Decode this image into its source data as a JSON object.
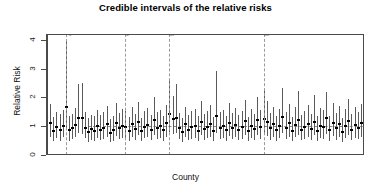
{
  "chart_data": {
    "type": "scatter",
    "title": "Credible intervals of the relative risks",
    "xlabel": "County",
    "ylabel": "Relative Risk",
    "ylim": [
      0,
      4.2
    ],
    "yticks": [
      0,
      1,
      2,
      3,
      4
    ],
    "ytick_labels": [
      "0",
      "1",
      "2",
      "3",
      "4"
    ],
    "xtick_labels": [],
    "grid": false,
    "legend": null,
    "reference_line": {
      "y": 1,
      "style": "dashed",
      "color": "#8a8a8a"
    },
    "annotations": [
      {
        "label": "Anson",
        "index": 5,
        "style": "dashed-vertical"
      },
      {
        "label": "Columbus",
        "index": 24,
        "style": "dashed-vertical"
      },
      {
        "label": "Halifax",
        "index": 38,
        "style": "dashed-vertical"
      },
      {
        "label": "Robeson",
        "index": 68,
        "style": "dashed-vertical"
      }
    ],
    "series_note": "Posterior median relative risk with 95% credible interval per county",
    "points": [
      {
        "i": 0,
        "median": 1.1,
        "low": 0.62,
        "high": 1.78
      },
      {
        "i": 1,
        "median": 0.82,
        "low": 0.47,
        "high": 1.32
      },
      {
        "i": 2,
        "median": 0.98,
        "low": 0.6,
        "high": 1.5
      },
      {
        "i": 3,
        "median": 0.88,
        "low": 0.5,
        "high": 1.42
      },
      {
        "i": 4,
        "median": 1.02,
        "low": 0.63,
        "high": 1.55
      },
      {
        "i": 5,
        "median": 1.68,
        "low": 0.95,
        "high": 3.95
      },
      {
        "i": 6,
        "median": 0.86,
        "low": 0.5,
        "high": 1.35
      },
      {
        "i": 7,
        "median": 0.92,
        "low": 0.55,
        "high": 1.44
      },
      {
        "i": 8,
        "median": 1.05,
        "low": 0.62,
        "high": 1.62
      },
      {
        "i": 9,
        "median": 1.3,
        "low": 0.75,
        "high": 2.45
      },
      {
        "i": 10,
        "median": 1.28,
        "low": 0.72,
        "high": 2.5
      },
      {
        "i": 11,
        "median": 0.95,
        "low": 0.58,
        "high": 1.48
      },
      {
        "i": 12,
        "median": 0.8,
        "low": 0.45,
        "high": 1.28
      },
      {
        "i": 13,
        "median": 0.9,
        "low": 0.52,
        "high": 1.4
      },
      {
        "i": 14,
        "median": 0.84,
        "low": 0.48,
        "high": 1.34
      },
      {
        "i": 15,
        "median": 1.0,
        "low": 0.6,
        "high": 1.55
      },
      {
        "i": 16,
        "median": 0.88,
        "low": 0.52,
        "high": 1.38
      },
      {
        "i": 17,
        "median": 0.94,
        "low": 0.55,
        "high": 1.5
      },
      {
        "i": 18,
        "median": 1.08,
        "low": 0.64,
        "high": 1.7
      },
      {
        "i": 19,
        "median": 0.78,
        "low": 0.44,
        "high": 1.26
      },
      {
        "i": 20,
        "median": 0.86,
        "low": 0.5,
        "high": 1.36
      },
      {
        "i": 21,
        "median": 1.12,
        "low": 0.66,
        "high": 1.82
      },
      {
        "i": 22,
        "median": 0.92,
        "low": 0.54,
        "high": 1.46
      },
      {
        "i": 23,
        "median": 1.02,
        "low": 0.6,
        "high": 1.6
      },
      {
        "i": 24,
        "median": 0.96,
        "low": 0.56,
        "high": 1.52
      },
      {
        "i": 25,
        "median": 0.84,
        "low": 0.48,
        "high": 1.33
      },
      {
        "i": 26,
        "median": 1.06,
        "low": 0.62,
        "high": 1.66
      },
      {
        "i": 27,
        "median": 0.9,
        "low": 0.53,
        "high": 1.42
      },
      {
        "i": 28,
        "median": 1.14,
        "low": 0.68,
        "high": 1.84
      },
      {
        "i": 29,
        "median": 0.82,
        "low": 0.47,
        "high": 1.3
      },
      {
        "i": 30,
        "median": 0.98,
        "low": 0.58,
        "high": 1.54
      },
      {
        "i": 31,
        "median": 1.04,
        "low": 0.62,
        "high": 1.62
      },
      {
        "i": 32,
        "median": 0.88,
        "low": 0.51,
        "high": 1.4
      },
      {
        "i": 33,
        "median": 1.2,
        "low": 0.7,
        "high": 2.0
      },
      {
        "i": 34,
        "median": 0.94,
        "low": 0.55,
        "high": 1.48
      },
      {
        "i": 35,
        "median": 1.0,
        "low": 0.6,
        "high": 1.56
      },
      {
        "i": 36,
        "median": 0.86,
        "low": 0.49,
        "high": 1.36
      },
      {
        "i": 37,
        "median": 1.1,
        "low": 0.64,
        "high": 1.74
      },
      {
        "i": 38,
        "median": 1.42,
        "low": 0.8,
        "high": 2.62
      },
      {
        "i": 39,
        "median": 1.24,
        "low": 0.72,
        "high": 2.05
      },
      {
        "i": 40,
        "median": 1.3,
        "low": 0.75,
        "high": 2.48
      },
      {
        "i": 41,
        "median": 0.92,
        "low": 0.54,
        "high": 1.45
      },
      {
        "i": 42,
        "median": 0.8,
        "low": 0.46,
        "high": 1.28
      },
      {
        "i": 43,
        "median": 1.06,
        "low": 0.62,
        "high": 1.68
      },
      {
        "i": 44,
        "median": 0.88,
        "low": 0.51,
        "high": 1.4
      },
      {
        "i": 45,
        "median": 0.96,
        "low": 0.57,
        "high": 1.52
      },
      {
        "i": 46,
        "median": 1.02,
        "low": 0.6,
        "high": 1.6
      },
      {
        "i": 47,
        "median": 0.84,
        "low": 0.48,
        "high": 1.34
      },
      {
        "i": 48,
        "median": 1.16,
        "low": 0.68,
        "high": 1.88
      },
      {
        "i": 49,
        "median": 0.9,
        "low": 0.53,
        "high": 1.43
      },
      {
        "i": 50,
        "median": 0.98,
        "low": 0.58,
        "high": 1.54
      },
      {
        "i": 51,
        "median": 1.08,
        "low": 0.63,
        "high": 1.72
      },
      {
        "i": 52,
        "median": 0.82,
        "low": 0.47,
        "high": 1.31
      },
      {
        "i": 53,
        "median": 1.34,
        "low": 0.78,
        "high": 2.92
      },
      {
        "i": 54,
        "median": 0.94,
        "low": 0.55,
        "high": 1.48
      },
      {
        "i": 55,
        "median": 1.0,
        "low": 0.59,
        "high": 1.57
      },
      {
        "i": 56,
        "median": 0.86,
        "low": 0.5,
        "high": 1.37
      },
      {
        "i": 57,
        "median": 1.12,
        "low": 0.66,
        "high": 1.8
      },
      {
        "i": 58,
        "median": 0.92,
        "low": 0.54,
        "high": 1.46
      },
      {
        "i": 59,
        "median": 1.04,
        "low": 0.61,
        "high": 1.64
      },
      {
        "i": 60,
        "median": 0.88,
        "low": 0.51,
        "high": 1.39
      },
      {
        "i": 61,
        "median": 0.96,
        "low": 0.56,
        "high": 1.51
      },
      {
        "i": 62,
        "median": 1.18,
        "low": 0.69,
        "high": 1.92
      },
      {
        "i": 63,
        "median": 0.84,
        "low": 0.48,
        "high": 1.33
      },
      {
        "i": 64,
        "median": 1.02,
        "low": 0.6,
        "high": 1.61
      },
      {
        "i": 65,
        "median": 0.9,
        "low": 0.52,
        "high": 1.43
      },
      {
        "i": 66,
        "median": 1.22,
        "low": 0.71,
        "high": 2.02
      },
      {
        "i": 67,
        "median": 0.98,
        "low": 0.57,
        "high": 1.55
      },
      {
        "i": 68,
        "median": 1.26,
        "low": 0.73,
        "high": 2.28
      },
      {
        "i": 69,
        "median": 1.14,
        "low": 0.67,
        "high": 1.86
      },
      {
        "i": 70,
        "median": 0.92,
        "low": 0.53,
        "high": 1.46
      },
      {
        "i": 71,
        "median": 1.06,
        "low": 0.62,
        "high": 1.68
      },
      {
        "i": 72,
        "median": 0.86,
        "low": 0.49,
        "high": 1.37
      },
      {
        "i": 73,
        "median": 1.0,
        "low": 0.58,
        "high": 1.58
      },
      {
        "i": 74,
        "median": 1.32,
        "low": 0.76,
        "high": 2.32
      },
      {
        "i": 75,
        "median": 0.94,
        "low": 0.55,
        "high": 1.49
      },
      {
        "i": 76,
        "median": 1.1,
        "low": 0.64,
        "high": 1.76
      },
      {
        "i": 77,
        "median": 0.82,
        "low": 0.47,
        "high": 1.31
      },
      {
        "i": 78,
        "median": 1.04,
        "low": 0.61,
        "high": 1.65
      },
      {
        "i": 79,
        "median": 1.2,
        "low": 0.7,
        "high": 2.22
      },
      {
        "i": 80,
        "median": 0.88,
        "low": 0.51,
        "high": 1.4
      },
      {
        "i": 81,
        "median": 0.96,
        "low": 0.56,
        "high": 1.52
      },
      {
        "i": 82,
        "median": 1.08,
        "low": 0.63,
        "high": 1.72
      },
      {
        "i": 83,
        "median": 0.9,
        "low": 0.52,
        "high": 1.43
      },
      {
        "i": 84,
        "median": 1.16,
        "low": 0.68,
        "high": 2.1
      },
      {
        "i": 85,
        "median": 0.84,
        "low": 0.48,
        "high": 1.34
      },
      {
        "i": 86,
        "median": 1.02,
        "low": 0.59,
        "high": 1.62
      },
      {
        "i": 87,
        "median": 0.98,
        "low": 0.57,
        "high": 1.55
      },
      {
        "i": 88,
        "median": 1.28,
        "low": 0.74,
        "high": 2.18
      },
      {
        "i": 89,
        "median": 0.86,
        "low": 0.5,
        "high": 1.37
      },
      {
        "i": 90,
        "median": 1.12,
        "low": 0.65,
        "high": 1.8
      },
      {
        "i": 91,
        "median": 0.92,
        "low": 0.53,
        "high": 1.46
      },
      {
        "i": 92,
        "median": 1.06,
        "low": 0.62,
        "high": 1.7
      },
      {
        "i": 93,
        "median": 0.8,
        "low": 0.45,
        "high": 1.29
      },
      {
        "i": 94,
        "median": 1.0,
        "low": 0.58,
        "high": 1.58
      },
      {
        "i": 95,
        "median": 1.18,
        "low": 0.69,
        "high": 1.94
      },
      {
        "i": 96,
        "median": 0.88,
        "low": 0.51,
        "high": 1.41
      },
      {
        "i": 97,
        "median": 1.04,
        "low": 0.6,
        "high": 1.66
      },
      {
        "i": 98,
        "median": 0.94,
        "low": 0.54,
        "high": 1.5
      },
      {
        "i": 99,
        "median": 1.1,
        "low": 0.64,
        "high": 1.78
      }
    ]
  }
}
